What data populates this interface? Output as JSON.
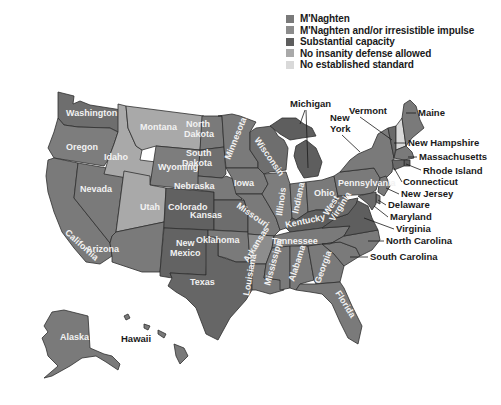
{
  "legend": {
    "items": [
      {
        "key": "mnaghten",
        "label": "M'Naghten",
        "color": "#7a7a7a"
      },
      {
        "key": "mnaghten_irresistible",
        "label": "M'Naghten and/or irresistible impulse",
        "color": "#8c8c8c"
      },
      {
        "key": "substantial",
        "label": "Substantial capacity",
        "color": "#5e5e5e"
      },
      {
        "key": "no_defense",
        "label": "No insanity defense allowed",
        "color": "#a9a9a9"
      },
      {
        "key": "no_standard",
        "label": "No established standard",
        "color": "#d9d9d9"
      }
    ]
  },
  "states": {
    "washington": {
      "label": "Washington",
      "category": "mnaghten"
    },
    "oregon": {
      "label": "Oregon",
      "category": "substantial"
    },
    "california": {
      "label": "California",
      "category": "mnaghten"
    },
    "nevada": {
      "label": "Nevada",
      "category": "mnaghten"
    },
    "idaho": {
      "label": "Idaho",
      "category": "no_defense"
    },
    "montana": {
      "label": "Montana",
      "category": "no_defense"
    },
    "wyoming": {
      "label": "Wyoming",
      "category": "mnaghten"
    },
    "utah": {
      "label": "Utah",
      "category": "no_defense"
    },
    "arizona": {
      "label": "Arizona",
      "category": "mnaghten"
    },
    "colorado": {
      "label": "Colorado",
      "category": "mnaghten_irresistible"
    },
    "new_mexico": {
      "label": "New",
      "label2": "Mexico",
      "category": "mnaghten_irresistible"
    },
    "north_dakota": {
      "label": "North",
      "label2": "Dakota",
      "category": "mnaghten"
    },
    "south_dakota": {
      "label": "South",
      "label2": "Dakota",
      "category": "mnaghten"
    },
    "nebraska": {
      "label": "Nebraska",
      "category": "mnaghten"
    },
    "kansas": {
      "label": "Kansas",
      "category": "no_defense"
    },
    "oklahoma": {
      "label": "Oklahoma",
      "category": "mnaghten"
    },
    "texas": {
      "label": "Texas",
      "category": "mnaghten"
    },
    "minnesota": {
      "label": "Minnesota",
      "category": "mnaghten"
    },
    "iowa": {
      "label": "Iowa",
      "category": "mnaghten"
    },
    "missouri": {
      "label": "Missouri",
      "category": "mnaghten"
    },
    "arkansas": {
      "label": "Arkansas",
      "category": "substantial"
    },
    "louisiana": {
      "label": "Louisiana",
      "category": "mnaghten"
    },
    "wisconsin": {
      "label": "Wisconsin",
      "category": "substantial"
    },
    "illinois": {
      "label": "Illinois",
      "category": "mnaghten"
    },
    "michigan": {
      "label": "Michigan",
      "category": "mnaghten_irresistible"
    },
    "indiana": {
      "label": "Indiana",
      "category": "mnaghten"
    },
    "ohio": {
      "label": "Ohio",
      "category": "mnaghten"
    },
    "kentucky": {
      "label": "Kentucky",
      "category": "substantial"
    },
    "tennessee": {
      "label": "Tennessee",
      "category": "mnaghten"
    },
    "mississippi": {
      "label": "Mississippi",
      "category": "mnaghten"
    },
    "alabama": {
      "label": "Alabama",
      "category": "mnaghten"
    },
    "georgia": {
      "label": "Georgia",
      "category": "mnaghten"
    },
    "florida": {
      "label": "Florida",
      "category": "mnaghten"
    },
    "south_carolina": {
      "label": "South Carolina",
      "category": "mnaghten"
    },
    "north_carolina": {
      "label": "North Carolina",
      "category": "mnaghten"
    },
    "virginia": {
      "label": "Virginia",
      "category": "mnaghten_irresistible"
    },
    "west_virginia": {
      "label": "West",
      "label2": "Virginia",
      "category": "substantial"
    },
    "pennsylvania": {
      "label": "Pennsylvania",
      "category": "mnaghten"
    },
    "new_york": {
      "label": "New",
      "label2": "York",
      "category": "mnaghten"
    },
    "vermont": {
      "label": "Vermont",
      "category": "substantial"
    },
    "new_hampshire": {
      "label": "New Hampshire",
      "category": "no_standard"
    },
    "maine": {
      "label": "Maine",
      "category": "mnaghten"
    },
    "massachusetts": {
      "label": "Massachusetts",
      "category": "mnaghten"
    },
    "rhode_island": {
      "label": "Rhode Island",
      "category": "substantial"
    },
    "connecticut": {
      "label": "Connecticut",
      "category": "substantial"
    },
    "new_jersey": {
      "label": "New Jersey",
      "category": "mnaghten"
    },
    "delaware": {
      "label": "Delaware",
      "category": "mnaghten"
    },
    "maryland": {
      "label": "Maryland",
      "category": "substantial"
    },
    "alaska": {
      "label": "Alaska",
      "category": "mnaghten"
    },
    "hawaii": {
      "label": "Hawaii",
      "category": "mnaghten"
    }
  }
}
